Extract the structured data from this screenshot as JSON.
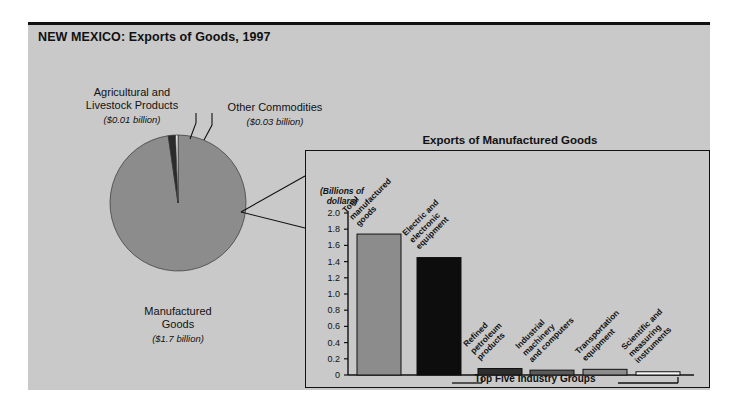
{
  "figure": {
    "title": "NEW MEXICO: Exports of Goods, 1997"
  },
  "pie": {
    "slices": [
      {
        "name": "Manufactured Goods",
        "label": "Manufactured\nGoods",
        "line1": "Manufactured",
        "line2": "Goods",
        "amount": "($1.7 billion)",
        "value": 1.7,
        "color": "#8c8c8c"
      },
      {
        "name": "Other Commodities",
        "line1": "Other Commodities",
        "line2": "",
        "amount": "($0.03 billion)",
        "value": 0.03,
        "color": "#2b2b2b"
      },
      {
        "name": "Agricultural and Livestock Products",
        "line1": "Agricultural and",
        "line2": "Livestock Products",
        "amount": "($0.01 billion)",
        "value": 0.01,
        "color": "#f2f2f2"
      }
    ]
  },
  "inset": {
    "title": "Exports of Manufactured Goods",
    "axis_caption_line1": "(Billions of",
    "axis_caption_line2": "dollars)",
    "bracket_label": "Top Five Industry Groups"
  },
  "chart_data": {
    "type": "bar",
    "title": "Exports of Manufactured Goods",
    "xlabel": "Top Five Industry Groups",
    "ylabel": "(Billions of dollars)",
    "ylim": [
      0,
      2.0
    ],
    "yticks": [
      "0",
      "0.2",
      "0.4",
      "0.6",
      "0.8",
      "1.0",
      "1.2",
      "1.4",
      "1.6",
      "1.8",
      "2.0"
    ],
    "ytick_values": [
      0,
      0.2,
      0.4,
      0.6,
      0.8,
      1.0,
      1.2,
      1.4,
      1.6,
      1.8,
      2.0
    ],
    "grid": false,
    "legend": "none",
    "categories": [
      "Total manufactured goods",
      "Electric and electronic equipment",
      "Refined petroleum products",
      "Industrial machinery and computers",
      "Transportation equipment",
      "Scientific and measuring instruments"
    ],
    "category_lines": [
      [
        "Total",
        "manufactured",
        "goods"
      ],
      [
        "Electric and",
        "electronic",
        "equipment"
      ],
      [
        "Refined",
        "petroleum",
        "products"
      ],
      [
        "Industrial",
        "machinery",
        "and computers"
      ],
      [
        "Transportation",
        "equipment"
      ],
      [
        "Scientific and",
        "measuring",
        "instruments"
      ]
    ],
    "values": [
      1.74,
      1.45,
      0.08,
      0.06,
      0.07,
      0.04
    ],
    "colors": [
      "#8c8c8c",
      "#0d0d0d",
      "#2e2e2e",
      "#5a5a5a",
      "#8c8c8c",
      "#f7f7f7"
    ]
  },
  "colors": {
    "panel_bg": "#c9c9c9",
    "ink": "#111111",
    "pie_main": "#8c8c8c",
    "pie_other": "#2b2b2b",
    "pie_ag": "#f2f2f2"
  }
}
